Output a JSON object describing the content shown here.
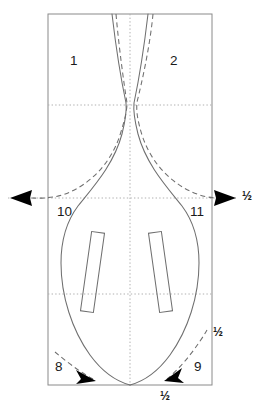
{
  "diagram": {
    "type": "technical-line-drawing",
    "background_color": "#ffffff",
    "stroke_colors": {
      "bounding_box": "#888888",
      "solid_outline": "#707070",
      "dashed_outline": "#707070",
      "grid_dotted": "#aaaaaa",
      "arrow_fill": "#000000",
      "text": "#1a1a1a"
    },
    "bounding_box": {
      "x": 48,
      "y": 14,
      "width": 164,
      "height": 371
    },
    "grid": {
      "vertical_centerline_x": 130,
      "horizontal_lines_y": [
        105,
        198,
        294
      ]
    }
  },
  "region_labels": [
    {
      "id": "region-1",
      "text": "1",
      "x": 70,
      "y": 62
    },
    {
      "id": "region-2",
      "text": "2",
      "x": 170,
      "y": 62
    },
    {
      "id": "region-10",
      "text": "10",
      "x": 57,
      "y": 212
    },
    {
      "id": "region-11",
      "text": "11",
      "x": 190,
      "y": 212
    },
    {
      "id": "region-8",
      "text": "8",
      "x": 55,
      "y": 367
    },
    {
      "id": "region-9",
      "text": "9",
      "x": 194,
      "y": 367
    }
  ],
  "dimension_labels": [
    {
      "id": "dim-right-waist",
      "text": "½",
      "x": 243,
      "y": 192
    },
    {
      "id": "dim-right-lower",
      "text": "½",
      "x": 215,
      "y": 329
    },
    {
      "id": "dim-bottom",
      "text": "½",
      "x": 161,
      "y": 395
    }
  ],
  "arrows": [
    {
      "id": "arrow-left-waist",
      "direction": "left",
      "tip_x": 10,
      "tip_y": 198
    },
    {
      "id": "arrow-right-waist",
      "direction": "right",
      "tip_x": 236,
      "tip_y": 198
    },
    {
      "id": "arrow-lower-left",
      "direction": "down-right",
      "tip_x": 96,
      "tip_y": 381
    },
    {
      "id": "arrow-lower-right",
      "direction": "down-left",
      "tip_x": 164,
      "tip_y": 381
    }
  ],
  "sound_holes": [
    {
      "id": "sound-hole-left",
      "x": 86,
      "y": 232,
      "width": 13,
      "height": 80,
      "rotation_deg": 8
    },
    {
      "id": "sound-hole-right",
      "x": 154,
      "y": 232,
      "width": 13,
      "height": 80,
      "rotation_deg": -8
    }
  ]
}
